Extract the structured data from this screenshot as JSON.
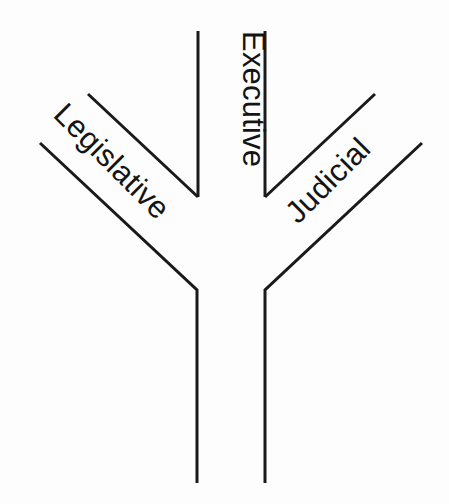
{
  "figure": {
    "background_color": "#fdfdfd",
    "line_color": "#1a1a1a",
    "text_color": "#141414",
    "width": 449,
    "height": 504
  },
  "labels": {
    "legislative": "Legislative",
    "executive": "Executive",
    "judicial": "Judicial"
  },
  "branches": [
    {
      "name": "legislative",
      "label": "Legislative",
      "rotation_deg": 45,
      "side": "left"
    },
    {
      "name": "executive",
      "label": "Executive",
      "rotation_deg": 90,
      "side": "center"
    },
    {
      "name": "judicial",
      "label": "Judicial",
      "rotation_deg": -45,
      "side": "right"
    }
  ]
}
